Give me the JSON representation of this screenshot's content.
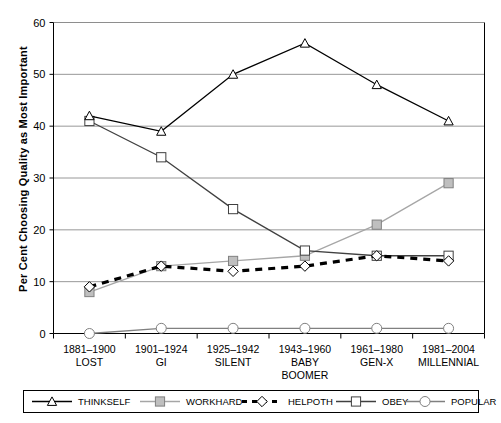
{
  "chart_data": {
    "type": "line",
    "title": "",
    "xlabel": "",
    "ylabel": "Per Cent Choosing Quality as Most Important",
    "ylim": [
      0,
      60
    ],
    "yticks": [
      0,
      10,
      20,
      30,
      40,
      50,
      60
    ],
    "grid": true,
    "legend_position": "bottom",
    "categories": [
      "1881–1900 LOST",
      "1901–1924 GI",
      "1925–1942 SILENT",
      "1943–1960 BABY BOOMER",
      "1961–1980 GEN-X",
      "1981–2004 MILLENNIAL"
    ],
    "category_lines": [
      [
        "1881–1900",
        "LOST"
      ],
      [
        "1901–1924",
        "GI"
      ],
      [
        "1925–1942",
        "SILENT"
      ],
      [
        "1943–1960",
        "BABY",
        "BOOMER"
      ],
      [
        "1961–1980",
        "GEN-X"
      ],
      [
        "1981–2004",
        "MILLENNIAL"
      ]
    ],
    "series": [
      {
        "name": "THINKSELF",
        "marker": "triangle",
        "color": "#000000",
        "line": "solid",
        "values": [
          42,
          39,
          50,
          56,
          48,
          41
        ]
      },
      {
        "name": "WORKHARD",
        "marker": "square",
        "color": "#a6a6a6",
        "line": "solid",
        "values": [
          8,
          13,
          14,
          15,
          21,
          29
        ]
      },
      {
        "name": "HELPOTH",
        "marker": "diamond",
        "color": "#000000",
        "line": "dashed",
        "values": [
          9,
          13,
          12,
          13,
          15,
          14
        ]
      },
      {
        "name": "OBEY",
        "marker": "square",
        "color": "#404040",
        "line": "solid",
        "values": [
          41,
          34,
          24,
          16,
          15,
          15
        ]
      },
      {
        "name": "POPULAR",
        "marker": "circle",
        "color": "#808080",
        "line": "solid",
        "values": [
          0,
          1,
          1,
          1,
          1,
          1
        ]
      }
    ]
  },
  "legend": {
    "items": [
      {
        "label": "THINKSELF"
      },
      {
        "label": "WORKHARD"
      },
      {
        "label": "HELPOTH"
      },
      {
        "label": "OBEY"
      },
      {
        "label": "POPULAR"
      }
    ]
  },
  "axis": {
    "y_tick_labels": [
      "0",
      "10",
      "20",
      "30",
      "40",
      "50",
      "60"
    ]
  }
}
